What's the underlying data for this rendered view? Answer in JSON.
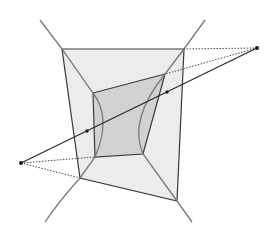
{
  "diagram": {
    "title": "",
    "colors": {
      "background": "#ffffff",
      "outer_fill": "#ececec",
      "inner_fill": "#d2d2d2",
      "edge": "#3a3a3a",
      "hyperbola": "#7a7a7a",
      "dotted": "#4a4a4a",
      "point": "#1a1a1a"
    },
    "outer_quad": [
      [
        62,
        49
      ],
      [
        184,
        49
      ],
      [
        177,
        201
      ],
      [
        80,
        178
      ]
    ],
    "inner_quad": [
      [
        93,
        93
      ],
      [
        165,
        74
      ],
      [
        143,
        154
      ],
      [
        95,
        157
      ]
    ],
    "points": {
      "right_focus": [
        257,
        48
      ],
      "left_focus": [
        21,
        163
      ],
      "upper_intersection": [
        167,
        92
      ],
      "lower_intersection": [
        87,
        131
      ]
    },
    "solid_line": [
      [
        21,
        163
      ],
      [
        257,
        48
      ]
    ],
    "dotted_lines": [
      [
        [
          257,
          48
        ],
        [
          184,
          49
        ]
      ],
      [
        [
          257,
          48
        ],
        [
          165,
          74
        ]
      ],
      [
        [
          21,
          163
        ],
        [
          95,
          157
        ]
      ],
      [
        [
          21,
          163
        ],
        [
          80,
          178
        ]
      ]
    ],
    "hyperbola_left": "M40,20 L62,49 L93,93 Q112,118 95,157 L80,178 Q60,200 45,222",
    "hyperbola_right": "M205,20 L184,49 L165,74 Q128,120 143,154 L177,201 L192,222"
  }
}
